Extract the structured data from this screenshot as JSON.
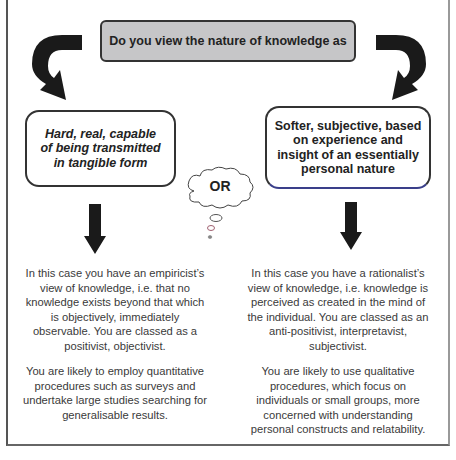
{
  "question": {
    "text": "Do you view the nature of knowledge as"
  },
  "options": {
    "left": {
      "text": "Hard, real, capable\nof being transmitted\nin tangible form"
    },
    "right": {
      "text": "Softer, subjective, based\non experience and\ninsight of an essentially\npersonal nature"
    },
    "separator": "OR"
  },
  "outcomes": {
    "left": {
      "paragraph1": "In this case you have an empiricist’s\nview of knowledge, i.e. that no\nknowledge exists beyond that which\nis objectively, immediately\nobservable.  You are classed as a\npositivist, objectivist.",
      "paragraph2": "You are likely to employ quantitative\nprocedures such as surveys and\nundertake large studies searching for\ngeneralisable results."
    },
    "right": {
      "paragraph1": "In this case you have a rationalist’s\nview of knowledge, i.e. knowledge is\nperceived as created in the mind of\nthe individual. You are classed as an\nanti-positivist, interpretavist,\nsubjectivist.",
      "paragraph2": "You are likely to use qualitative\nprocedures, which focus on\nindividuals or small groups, more\nconcerned with understanding\npersonal constructs and relatability."
    }
  },
  "icons": {
    "curved_arrow_left": "curved-arrow-down-left-icon",
    "curved_arrow_right": "curved-arrow-down-right-icon",
    "down_arrow": "arrow-down-icon",
    "thought_cloud": "thought-bubble-icon"
  },
  "colors": {
    "question_fill": "#c6c6c8",
    "arrow": "#1a1a1a",
    "border": "#333333"
  }
}
